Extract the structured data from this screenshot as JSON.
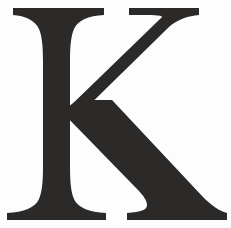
{
  "image": {
    "kind": "letterform-specimen",
    "character": "K",
    "case": "uppercase",
    "script": "Latin",
    "style": "serif",
    "weight": "bold",
    "width_px": 231,
    "height_px": 228,
    "glyph_color": "#2b2a29",
    "background_color": "#fdfdfd",
    "alt_text": "Bold serif capital letter K"
  },
  "metrics": {
    "cap_top_y": 8,
    "baseline_y": 220,
    "stem_left_x": 29,
    "stem_right_x": 70,
    "top_serif_left_x": 13,
    "top_serif_right_x": 104,
    "bottom_serif_left_x": 7,
    "bottom_serif_right_x": 106,
    "arm_serif_left_x": 129,
    "arm_serif_right_x": 199,
    "leg_serif_left_x": 127,
    "leg_serif_right_x": 227,
    "junction_y": 118
  },
  "geometry": {
    "stem": "M13,8 L104,8 L104,15 C88,16 78,20 74,29 C71,36 70,46 70,62 L70,166 C70,182 71,192 74,199 C78,208 89,212 106,213 L106,220 L7,220 L7,213 C24,212 35,208 39,199 C42,192 43,182 43,166 L43,62 C43,46 42,36 39,29 C35,20 25,16 13,15 Z",
    "arm": "M129,8 L199,8 L199,15 C188,16 179,19 170,26 L73,121 L64,112 L160,19 C164,16 162,15.5 151,15 L129,15 Z",
    "leg": "M77,100 L112,100 L203,197 C211,205 219,211 227,213 L227,220 L127,220 L127,213 C141,212 147,210 147,205 C147,201 144,196 137,189 L62,112 Z"
  },
  "labels": {
    "figure_caption": "K"
  }
}
